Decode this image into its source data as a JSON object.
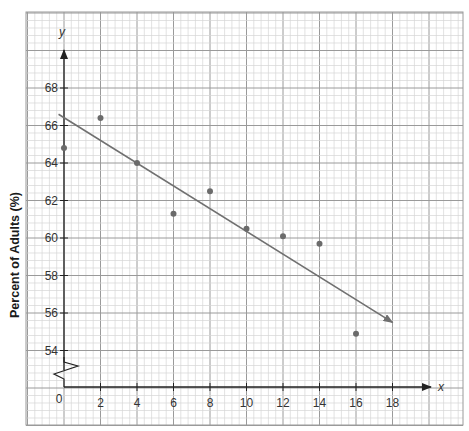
{
  "chart_data": {
    "type": "scatter",
    "title": "",
    "xlabel": "x",
    "ylabel": "Percent of Adults (%)",
    "y_axis_letter": "y",
    "x_ticks": [
      0,
      2,
      4,
      6,
      8,
      10,
      12,
      14,
      16,
      18
    ],
    "y_ticks": [
      54,
      56,
      58,
      60,
      62,
      64,
      66,
      68
    ],
    "xlim": [
      0,
      20
    ],
    "ylim": [
      52,
      70
    ],
    "y_axis_break": true,
    "grid": true,
    "points": [
      {
        "x": 0,
        "y": 64.8
      },
      {
        "x": 2,
        "y": 66.4
      },
      {
        "x": 4,
        "y": 64.0
      },
      {
        "x": 6,
        "y": 61.3
      },
      {
        "x": 8,
        "y": 62.5
      },
      {
        "x": 10,
        "y": 60.5
      },
      {
        "x": 12,
        "y": 60.1
      },
      {
        "x": 14,
        "y": 59.7
      },
      {
        "x": 16,
        "y": 54.9
      }
    ],
    "trend_line": {
      "x1": -0.3,
      "y1": 66.6,
      "x2": 18,
      "y2": 55.5,
      "arrow_end": true
    },
    "colors": {
      "grid_minor": "#d6d6d6",
      "grid_major": "#9a9a9a",
      "axis": "#222222",
      "point": "#6b6b6b",
      "line": "#707070"
    }
  }
}
